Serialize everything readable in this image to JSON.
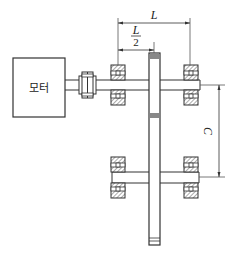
{
  "diagram": {
    "type": "mechanical-schematic",
    "motor": {
      "label": "모터"
    },
    "dimensions": {
      "L": {
        "label": "L"
      },
      "half_L": {
        "numerator": "L",
        "denominator": "2"
      },
      "C": {
        "label": "C"
      }
    },
    "components": [
      {
        "name": "motor",
        "label": "모터"
      },
      {
        "name": "coupling"
      },
      {
        "name": "upper-shaft"
      },
      {
        "name": "upper-left-bearing"
      },
      {
        "name": "upper-right-bearing"
      },
      {
        "name": "gear"
      },
      {
        "name": "lower-shaft"
      },
      {
        "name": "lower-left-bearing"
      },
      {
        "name": "lower-right-bearing"
      }
    ],
    "colors": {
      "line": "#333333",
      "hatch": "#555555",
      "gear_tooth": "#888888"
    }
  }
}
